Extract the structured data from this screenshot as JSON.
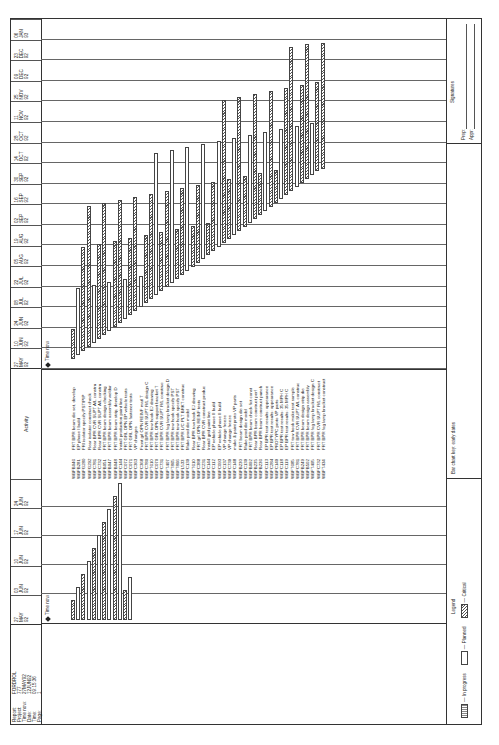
{
  "report": {
    "labels": [
      "Report:",
      "Project:",
      "Time now:",
      "Date:",
      "Time:",
      "Page:"
    ],
    "values": [
      "FORDROL",
      "777",
      "27MAY92",
      "12JUN92",
      "09:15:36",
      "1"
    ]
  },
  "title": "Bumper",
  "activity_header": "Activity",
  "left_dates": [
    {
      "d": "27",
      "m": "MAY",
      "y": "92"
    },
    {
      "d": "03",
      "m": "JUN",
      "y": "92"
    },
    {
      "d": "10",
      "m": "JUN",
      "y": "92"
    },
    {
      "d": "17",
      "m": "JUN",
      "y": "92"
    },
    {
      "d": "24",
      "m": "JUN",
      "y": "92"
    }
  ],
  "right_dates": [
    {
      "d": "27",
      "m": "MAY",
      "y": "92"
    },
    {
      "d": "10",
      "m": "JUN",
      "y": "92"
    },
    {
      "d": "24",
      "m": "JUN",
      "y": "92"
    },
    {
      "d": "08",
      "m": "JUL",
      "y": "92"
    },
    {
      "d": "22",
      "m": "JUL",
      "y": "92"
    },
    {
      "d": "05",
      "m": "AUG",
      "y": "92"
    },
    {
      "d": "19",
      "m": "AUG",
      "y": "92"
    },
    {
      "d": "02",
      "m": "SEP",
      "y": "92"
    },
    {
      "d": "16",
      "m": "SEP",
      "y": "92"
    },
    {
      "d": "30",
      "m": "SEP",
      "y": "92"
    },
    {
      "d": "14",
      "m": "OCT",
      "y": "92"
    },
    {
      "d": "28",
      "m": "OCT",
      "y": "92"
    },
    {
      "d": "11",
      "m": "NOV",
      "y": "92"
    },
    {
      "d": "25",
      "m": "NOV",
      "y": "92"
    },
    {
      "d": "09",
      "m": "DEC",
      "y": "92"
    },
    {
      "d": "23",
      "m": "DEC",
      "y": "92"
    },
    {
      "d": "06",
      "m": "JAN",
      "y": "93"
    }
  ],
  "time_now_label": "Time now",
  "activities": [
    {
      "code": "WBFB046",
      "name": "FRT BPR beam die set, develop"
    },
    {
      "code": "WBFB281",
      "name": "EP phase I build"
    },
    {
      "code": "WBFG280",
      "name": "FRI isolator specify PST/PIP"
    },
    {
      "code": "WBFG292",
      "name": "Rear isolator construct check"
    },
    {
      "code": "WBFC781",
      "name": "Rear BPR CVR SUPT A/L constru"
    },
    {
      "code": "WBFC732",
      "name": "Rear BPR CVR SUPT A/L constru"
    },
    {
      "code": "WBFB051",
      "name": "FRT BPR beam design checking"
    },
    {
      "code": "WBFB047",
      "name": "FRT BPR beam assembly weldar"
    },
    {
      "code": "WBFB048",
      "name": "FRT BPR beam strip, develop D"
    },
    {
      "code": "WBFC144",
      "name": "Install production paint line"
    },
    {
      "code": "WBFC072",
      "name": "FRT GRL OPN EP vehicle tests"
    },
    {
      "code": "WBFC071",
      "name": "FRT GRL OPN fastener tests"
    },
    {
      "code": "WBFC363",
      "name": "VP changes"
    },
    {
      "code": "WBFC368",
      "name": "Front grl OPN REINF matl T"
    },
    {
      "code": "WBFC780",
      "name": "FRT BPR CVR SUPT R/L design C"
    },
    {
      "code": "WBFT610",
      "name": "FRT BPR tow hook EJ drawing"
    },
    {
      "code": "WBFC070",
      "name": "FRT GRL OPN support bracket T"
    },
    {
      "code": "WBFC731",
      "name": "FRT BPR CVR SUPT R/L construc"
    },
    {
      "code": "WBFT407",
      "name": "FRT BPR fog lamp bracket design D"
    },
    {
      "code": "WBFT865",
      "name": "FRT BPR tow hook specify PST"
    },
    {
      "code": "WBFT866",
      "name": "FRT BPR tow hook specify PST"
    },
    {
      "code": "WBFL533",
      "name": "FRT BPR L/C PLT BRKT construc"
    },
    {
      "code": "WBFC139",
      "name": "Make prod die model"
    },
    {
      "code": "WBFT610",
      "name": "Rear BPR tow hook EJ drawing"
    },
    {
      "code": "WBFC388",
      "name": "FRT grl OPN REINF tests"
    },
    {
      "code": "WBFC231",
      "name": "Rear BPR CVR construct produc"
    },
    {
      "code": "WBFC144",
      "name": "Install grid paint line"
    },
    {
      "code": "WBFC112",
      "name": "EP vehicle phase II build"
    },
    {
      "code": "WBFC093",
      "name": "EP vehicle phase II build"
    },
    {
      "code": "WBFC137",
      "name": "VP change freeze"
    },
    {
      "code": "WBFC739",
      "name": "VP change freeze"
    },
    {
      "code": "WBFC148",
      "name": "make & paint proto VP parts"
    },
    {
      "code": "WBFB230",
      "name": "FRT beam design die set"
    },
    {
      "code": "WBFC139",
      "name": "Make prod die model"
    },
    {
      "code": "WBFB092",
      "name": "FRT BPR beam check fict const"
    },
    {
      "code": "WBFB235",
      "name": "Rear BPR beam construct perf"
    },
    {
      "code": "WBFB236",
      "name": "Rear BPR beam construct punch"
    },
    {
      "code": "WBFC113",
      "name": "EP BPR test results: appearance"
    },
    {
      "code": "WBFC284",
      "name": "EP BPR test results: appearance"
    },
    {
      "code": "WBFC149",
      "name": "PROTYPC proto VP parts"
    },
    {
      "code": "WBFC118",
      "name": "EP BPR test results: 35 MPH C"
    },
    {
      "code": "WBFC119",
      "name": "EP BPR test results: 35 MPH C"
    },
    {
      "code": "WBFT685",
      "name": "FRT tow hook make test sample"
    },
    {
      "code": "WBFC781",
      "name": "FRT BPR CVR SUPT A/L construc"
    },
    {
      "code": "WBFB249",
      "name": "FRT BPR beam design strip die"
    },
    {
      "code": "WBFB502",
      "name": "FRT BPR beam design assembly"
    },
    {
      "code": "WBFT495",
      "name": "FRT BPR fog lamp bracket design C"
    },
    {
      "code": "WBFC732",
      "name": "FRT BPR CVR SUPT R/L construct"
    },
    {
      "code": "WBFT434",
      "name": "FRT BPR fog lamp bracket construct"
    }
  ],
  "legend": {
    "title": "Legend",
    "in_progress": "— In progress",
    "planned": "— Planned",
    "critical": "— Critical"
  },
  "bar_key": "Bar chart key: early dates",
  "signatures": {
    "title": "Signatures",
    "prep": "Prep:",
    "appr": "Appr:"
  }
}
